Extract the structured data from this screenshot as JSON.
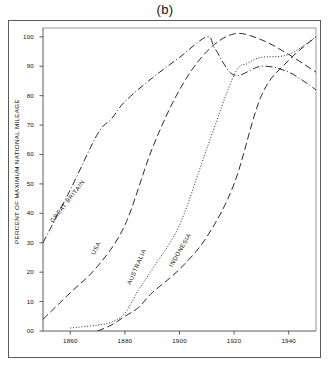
{
  "figure": {
    "title": "(b)",
    "ylabel": "PERCENT OF MAXIMUM NATIONAL MILEAGE"
  },
  "chart_data": {
    "type": "line",
    "title": "(b)",
    "xlabel": "",
    "ylabel": "PERCENT OF MAXIMUM NATIONAL MILEAGE",
    "xlim": [
      1850,
      1950
    ],
    "ylim": [
      0,
      103
    ],
    "grid": false,
    "legend": "inline-curve-labels",
    "xticks": [
      1860,
      1880,
      1900,
      1920,
      1940
    ],
    "xtick_labels": [
      "1860",
      "1880",
      "1900",
      "1920",
      "1940"
    ],
    "yticks": [
      0,
      10,
      20,
      30,
      40,
      50,
      60,
      70,
      80,
      90,
      100
    ],
    "ytick_labels": [
      "00",
      "10",
      "20",
      "30",
      "40",
      "50",
      "60",
      "70",
      "80",
      "90",
      "100"
    ],
    "series": [
      {
        "name": "GREAT BRITAIN",
        "style": "dash-dot",
        "label_angle": -52,
        "x": [
          1850,
          1860,
          1870,
          1875,
          1880,
          1890,
          1900,
          1910,
          1913,
          1920,
          1930,
          1940,
          1950
        ],
        "values": [
          30,
          48,
          67,
          72,
          78,
          86,
          93,
          100,
          96,
          87,
          90,
          88,
          82
        ]
      },
      {
        "name": "USA",
        "style": "long-dash",
        "label_angle": -62,
        "x": [
          1850,
          1860,
          1870,
          1880,
          1890,
          1900,
          1910,
          1920,
          1930,
          1940,
          1950
        ],
        "values": [
          4,
          13,
          22,
          36,
          62,
          82,
          95,
          101,
          99,
          94,
          88
        ]
      },
      {
        "name": "AUSTRALIA",
        "style": "dotted",
        "label_angle": -66,
        "x": [
          1860,
          1870,
          1875,
          1880,
          1885,
          1890,
          1900,
          1910,
          1920,
          1925,
          1930,
          1940,
          1950
        ],
        "values": [
          1,
          2,
          3,
          6,
          14,
          21,
          36,
          62,
          87,
          91,
          93,
          94,
          100
        ]
      },
      {
        "name": "INDONESIA",
        "style": "long-dash",
        "label_angle": -60,
        "x": [
          1870,
          1875,
          1880,
          1885,
          1890,
          1900,
          1910,
          1920,
          1930,
          1940,
          1950
        ],
        "values": [
          0,
          2,
          5,
          8,
          13,
          21,
          32,
          50,
          80,
          92,
          100
        ]
      }
    ]
  }
}
